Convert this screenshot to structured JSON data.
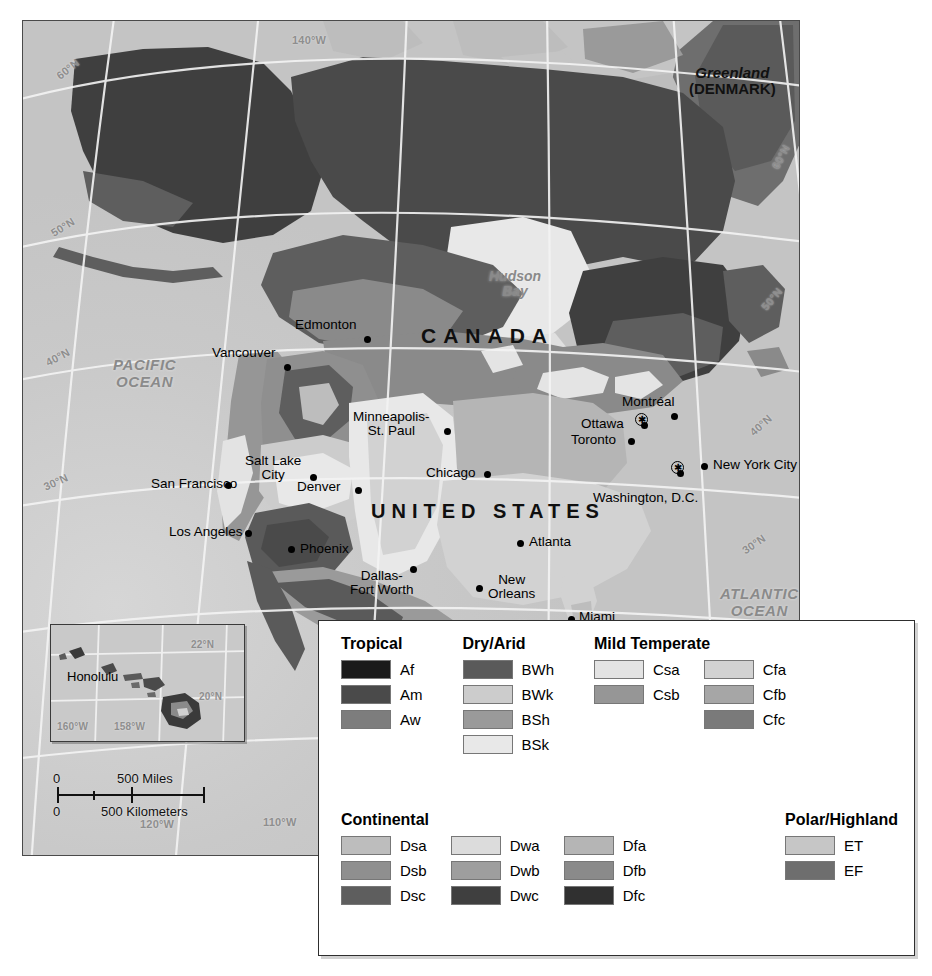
{
  "map": {
    "title": "North America Climate Regions",
    "countries": [
      {
        "name": "CANADA",
        "x": 398,
        "y": 303
      },
      {
        "name": "UNITED STATES",
        "x": 348,
        "y": 479
      }
    ],
    "territories": [
      {
        "name": "Greenland",
        "sub": "(DENMARK)",
        "x": 666,
        "y": 44
      }
    ],
    "water_bodies": [
      {
        "name": "PACIFIC\nOCEAN",
        "label1": "PACIFIC",
        "label2": "OCEAN",
        "x": 90,
        "y": 336,
        "style": "ocean"
      },
      {
        "name": "ATLANTIC\nOCEAN",
        "label1": "ATLANTIC",
        "label2": "OCEAN",
        "x": 697,
        "y": 565,
        "style": "ocean"
      },
      {
        "name": "Hudson\nBay",
        "label1": "Hudson",
        "label2": "Bay",
        "x": 466,
        "y": 248,
        "style": "bay"
      },
      {
        "name": "Gulf of Mexico",
        "label1": "Gulf of Mexico",
        "label2": "",
        "x": 474,
        "y": 599,
        "style": "gulf"
      }
    ],
    "cities": [
      {
        "name": "Edmonton",
        "dot_x": 344,
        "dot_y": 318,
        "label_x": 272,
        "label_y": 297,
        "align": "left",
        "lines": 1
      },
      {
        "name": "Vancouver",
        "dot_x": 264,
        "dot_y": 346,
        "label_x": 189,
        "label_y": 325,
        "align": "left",
        "lines": 1
      },
      {
        "name": "Montréal",
        "dot_x": 651,
        "dot_y": 395,
        "label_x": 599,
        "label_y": 374,
        "align": "left",
        "lines": 1
      },
      {
        "name": "Ottawa",
        "dot_x": 621,
        "dot_y": 404,
        "label_x": 558,
        "label_y": 396,
        "align": "left",
        "lines": 1,
        "capital": true,
        "star_x": 618,
        "star_y": 398
      },
      {
        "name": "Toronto",
        "dot_x": 608,
        "dot_y": 420,
        "label_x": 548,
        "label_y": 412,
        "align": "left",
        "lines": 1
      },
      {
        "name": "New York City",
        "dot_x": 681,
        "dot_y": 445,
        "label_x": 690,
        "label_y": 437,
        "align": "left",
        "lines": 1
      },
      {
        "name": "Washington, D.C.",
        "dot_x": 657,
        "dot_y": 452,
        "label_x": 570,
        "label_y": 470,
        "align": "left",
        "lines": 1,
        "capital": true,
        "star_x": 654,
        "star_y": 446
      },
      {
        "name": "Minneapolis-\nSt. Paul",
        "dot_x": 424,
        "dot_y": 410,
        "label_x": 330,
        "label_y": 389,
        "align": "center",
        "lines": 2,
        "label1": "Minneapolis-",
        "label2": "St. Paul"
      },
      {
        "name": "Chicago",
        "dot_x": 464,
        "dot_y": 453,
        "label_x": 403,
        "label_y": 445,
        "align": "left",
        "lines": 1
      },
      {
        "name": "Salt Lake\nCity",
        "dot_x": 290,
        "dot_y": 456,
        "label_x": 222,
        "label_y": 433,
        "align": "center",
        "lines": 2,
        "label1": "Salt Lake",
        "label2": "City"
      },
      {
        "name": "San Francisco",
        "dot_x": 205,
        "dot_y": 464,
        "label_x": 128,
        "label_y": 456,
        "align": "left",
        "lines": 1
      },
      {
        "name": "Denver",
        "dot_x": 335,
        "dot_y": 469,
        "label_x": 274,
        "label_y": 459,
        "align": "left",
        "lines": 1
      },
      {
        "name": "Los Angeles",
        "dot_x": 225,
        "dot_y": 512,
        "label_x": 146,
        "label_y": 504,
        "align": "left",
        "lines": 1
      },
      {
        "name": "Phoenix",
        "dot_x": 268,
        "dot_y": 528,
        "label_x": 277,
        "label_y": 521,
        "align": "left",
        "lines": 1
      },
      {
        "name": "Atlanta",
        "dot_x": 497,
        "dot_y": 522,
        "label_x": 506,
        "label_y": 514,
        "align": "left",
        "lines": 1
      },
      {
        "name": "Dallas-\nFort Worth",
        "dot_x": 390,
        "dot_y": 548,
        "label_x": 327,
        "label_y": 548,
        "align": "center",
        "lines": 2,
        "label1": "Dallas-",
        "label2": "Fort Worth"
      },
      {
        "name": "New\nOrleans",
        "dot_x": 456,
        "dot_y": 567,
        "label_x": 465,
        "label_y": 552,
        "align": "center",
        "lines": 2,
        "label1": "New",
        "label2": "Orleans"
      },
      {
        "name": "Miami",
        "dot_x": 548,
        "dot_y": 598,
        "label_x": 556,
        "label_y": 589,
        "align": "left",
        "lines": 1
      }
    ],
    "graticule_labels": [
      {
        "text": "60°N",
        "x": 32,
        "y": 42,
        "rot": -38
      },
      {
        "text": "50°N",
        "x": 27,
        "y": 200,
        "rot": -32
      },
      {
        "text": "40°N",
        "x": 22,
        "y": 330,
        "rot": -28
      },
      {
        "text": "30°N",
        "x": 20,
        "y": 455,
        "rot": -24
      },
      {
        "text": "140°W",
        "x": 269,
        "y": 13,
        "rot": 0
      },
      {
        "text": "120°W",
        "x": 117,
        "y": 797,
        "rot": 0
      },
      {
        "text": "110°W",
        "x": 240,
        "y": 795,
        "rot": 0
      },
      {
        "text": "60°N",
        "x": 745,
        "y": 130,
        "rot": -62
      },
      {
        "text": "50°N",
        "x": 736,
        "y": 272,
        "rot": -50
      },
      {
        "text": "40°N",
        "x": 725,
        "y": 398,
        "rot": -42
      },
      {
        "text": "30°N",
        "x": 718,
        "y": 517,
        "rot": -34
      }
    ]
  },
  "hawaii_inset": {
    "city": "Honolulu",
    "graticule_labels": [
      {
        "text": "22°N",
        "x": 140,
        "y": 14
      },
      {
        "text": "20°N",
        "x": 148,
        "y": 66
      },
      {
        "text": "160°W",
        "x": 6,
        "y": 96
      },
      {
        "text": "158°W",
        "x": 63,
        "y": 96
      }
    ]
  },
  "scale_bar": {
    "miles_zero": "0",
    "miles_label": "500 Miles",
    "km_zero": "0",
    "km_label": "500 Kilometers"
  },
  "legend": {
    "groups": [
      {
        "id": "tropical",
        "title": "Tropical",
        "columns": [
          {
            "items": [
              {
                "code": "Af",
                "color": "#1a1a1a"
              },
              {
                "code": "Am",
                "color": "#4a4a4a"
              },
              {
                "code": "Aw",
                "color": "#7d7d7d"
              }
            ]
          }
        ]
      },
      {
        "id": "dry-arid",
        "title": "Dry/Arid",
        "columns": [
          {
            "items": [
              {
                "code": "BWh",
                "color": "#5a5a5a"
              },
              {
                "code": "BWk",
                "color": "#cccccc"
              },
              {
                "code": "BSh",
                "color": "#9a9a9a"
              },
              {
                "code": "BSk",
                "color": "#e8e8e8"
              }
            ]
          }
        ]
      },
      {
        "id": "mild-temperate",
        "title": "Mild Temperate",
        "columns": [
          {
            "items": [
              {
                "code": "Csa",
                "color": "#e3e3e3"
              },
              {
                "code": "Csb",
                "color": "#969696"
              }
            ]
          },
          {
            "items": [
              {
                "code": "Cfa",
                "color": "#d2d2d2"
              },
              {
                "code": "Cfb",
                "color": "#a6a6a6"
              },
              {
                "code": "Cfc",
                "color": "#7a7a7a"
              }
            ]
          }
        ]
      },
      {
        "id": "continental",
        "title": "Continental",
        "columns": [
          {
            "items": [
              {
                "code": "Dsa",
                "color": "#bdbdbd"
              },
              {
                "code": "Dsb",
                "color": "#8f8f8f"
              },
              {
                "code": "Dsc",
                "color": "#5e5e5e"
              }
            ]
          },
          {
            "items": [
              {
                "code": "Dwa",
                "color": "#dcdcdc"
              },
              {
                "code": "Dwb",
                "color": "#9e9e9e"
              },
              {
                "code": "Dwc",
                "color": "#3f3f3f"
              }
            ]
          },
          {
            "items": [
              {
                "code": "Dfa",
                "color": "#b5b5b5"
              },
              {
                "code": "Dfb",
                "color": "#8a8a8a"
              },
              {
                "code": "Dfc",
                "color": "#303030"
              }
            ]
          }
        ]
      },
      {
        "id": "polar-highland",
        "title": "Polar/Highland",
        "columns": [
          {
            "items": [
              {
                "code": "ET",
                "color": "#c6c6c6"
              },
              {
                "code": "EF",
                "color": "#6e6e6e"
              }
            ]
          }
        ]
      }
    ]
  }
}
